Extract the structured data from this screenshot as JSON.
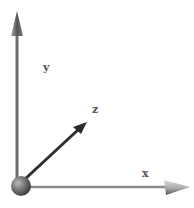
{
  "diagram": {
    "axes": [
      {
        "id": "x",
        "label": "x",
        "color": "#8a8a8a"
      },
      {
        "id": "y",
        "label": "y",
        "color": "#6e6e6e"
      },
      {
        "id": "z",
        "label": "z",
        "color": "#333333"
      }
    ],
    "origin": {
      "shape": "sphere",
      "color": "#6a6a6a"
    }
  }
}
